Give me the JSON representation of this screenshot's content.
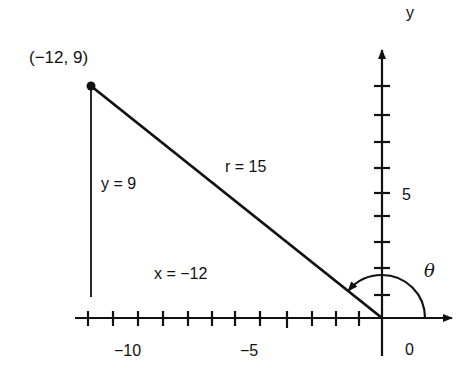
{
  "diagram": {
    "type": "reference-angle-triangle",
    "point_label": "(−12, 9)",
    "point": {
      "x": -12,
      "y": 9
    },
    "labels": {
      "opposite": "y = 9",
      "hypotenuse": "r = 15",
      "adjacent": "x = −12",
      "angle": "θ",
      "y_axis": "y",
      "x_tick_minus10": "−10",
      "x_tick_minus5": "−5",
      "origin": "0",
      "y_tick_5": "5"
    },
    "axes": {
      "x_range": [
        -12,
        2
      ],
      "y_range": [
        -1,
        10
      ],
      "x_ticks": [
        -12,
        -11,
        -10,
        -9,
        -8,
        -7,
        -6,
        -5,
        -4,
        -3,
        -2,
        -1
      ],
      "y_ticks": [
        1,
        2,
        3,
        4,
        5,
        6,
        7,
        8,
        9
      ]
    },
    "colors": {
      "stroke": "#111111",
      "background": "#ffffff"
    }
  }
}
